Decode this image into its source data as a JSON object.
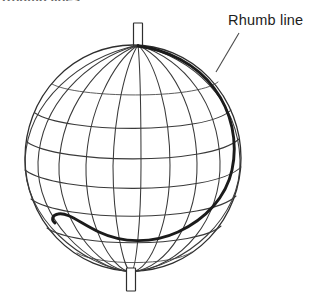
{
  "figure": {
    "type": "diagram",
    "background_color": "#ffffff",
    "width": 321,
    "height": 304,
    "cropped_caption_fragment": "Rhumb lines",
    "annotations": [
      {
        "id": "rhumb-line",
        "label": "Rhumb line",
        "leader": {
          "from_x": 239,
          "from_y": 33,
          "to_x": 216,
          "to_y": 72
        }
      }
    ],
    "globe": {
      "center_x": 133,
      "center_y": 158,
      "radius_x": 108,
      "radius_y": 113,
      "north_pole_x": 138,
      "north_pole_y": 45,
      "south_pole_x": 131,
      "south_pole_y": 272,
      "meridian_count": 12,
      "parallel_count": 7,
      "outline_color": "#2e2e2e",
      "graticule_color": "#3a3a3a",
      "rhumb_color": "#1b1b1b"
    },
    "axis_pins": [
      {
        "id": "north-pole-pin",
        "x": 133,
        "y": 22,
        "width": 10,
        "height": 25
      },
      {
        "id": "south-pole-pin",
        "x": 126,
        "y": 268,
        "width": 10,
        "height": 24
      }
    ],
    "rhumb_path": {
      "description": "Loxodrome spiralling from the north pole south-eastward around the right limb and terminating at lower left",
      "start_x": 138,
      "start_y": 45,
      "end_x": 55,
      "end_y": 222
    }
  }
}
